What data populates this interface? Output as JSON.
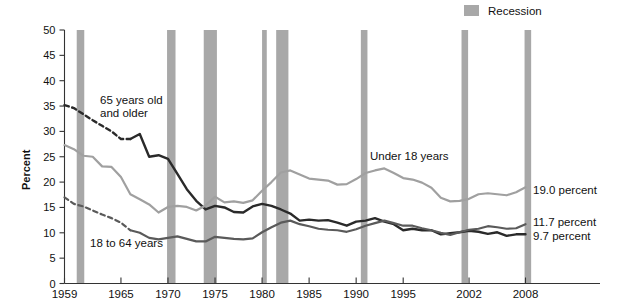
{
  "chart_data": {
    "type": "line",
    "title": "",
    "xlabel": "",
    "ylabel": "Percent",
    "ylim": [
      0,
      50
    ],
    "xlim": [
      1959,
      2008
    ],
    "ytickstep": 5,
    "grid": false,
    "legend_position": "top-right",
    "ytick_labels": [
      "0",
      "5",
      "10",
      "15",
      "20",
      "25",
      "30",
      "35",
      "40",
      "45",
      "50"
    ],
    "xtick_labels": [
      "1959",
      "1965",
      "1970",
      "1975",
      "1980",
      "1985",
      "1990",
      "1995",
      "2002",
      "2008"
    ],
    "xtick_values": [
      1959,
      1965,
      1970,
      1975,
      1980,
      1985,
      1990,
      1995,
      2002,
      2008
    ],
    "legend": [
      {
        "label": "Recession",
        "color": "#a8a8a8",
        "type": "band"
      }
    ],
    "series": [
      {
        "name": "65 years old and older",
        "color": "#2a2a2a",
        "label_text": "65 years old\nand older",
        "label_line1": "65 years old",
        "label_line2": "and older",
        "end_label": "9.7 percent",
        "end_value": 9.7,
        "dashed_until": 1966,
        "x": [
          1959,
          1960,
          1961,
          1962,
          1963,
          1964,
          1965,
          1966,
          1967,
          1968,
          1969,
          1970,
          1971,
          1972,
          1973,
          1974,
          1975,
          1976,
          1977,
          1978,
          1979,
          1980,
          1981,
          1982,
          1983,
          1984,
          1985,
          1986,
          1987,
          1988,
          1989,
          1990,
          1991,
          1992,
          1993,
          1994,
          1995,
          1996,
          1997,
          1998,
          1999,
          2000,
          2001,
          2002,
          2003,
          2004,
          2005,
          2006,
          2007,
          2008
        ],
        "values": [
          35.2,
          34.6,
          33.4,
          32.2,
          31.1,
          30.0,
          28.5,
          28.5,
          29.5,
          25.0,
          25.3,
          24.6,
          21.6,
          18.6,
          16.3,
          14.6,
          15.3,
          15.0,
          14.1,
          14.0,
          15.2,
          15.7,
          15.3,
          14.6,
          13.8,
          12.4,
          12.6,
          12.4,
          12.5,
          12.0,
          11.4,
          12.2,
          12.4,
          12.9,
          12.2,
          11.7,
          10.5,
          10.8,
          10.5,
          10.5,
          9.7,
          9.9,
          10.1,
          10.4,
          10.2,
          9.8,
          10.1,
          9.4,
          9.7,
          9.7
        ]
      },
      {
        "name": "Under 18 years",
        "color": "#a0a0a0",
        "label_text": "Under 18 years",
        "end_label": "19.0 percent",
        "end_value": 19.0,
        "dashed_until": null,
        "x": [
          1959,
          1960,
          1961,
          1962,
          1963,
          1964,
          1965,
          1966,
          1967,
          1968,
          1969,
          1970,
          1971,
          1972,
          1973,
          1974,
          1975,
          1976,
          1977,
          1978,
          1979,
          1980,
          1981,
          1982,
          1983,
          1984,
          1985,
          1986,
          1987,
          1988,
          1989,
          1990,
          1991,
          1992,
          1993,
          1994,
          1995,
          1996,
          1997,
          1998,
          1999,
          2000,
          2001,
          2002,
          2003,
          2004,
          2005,
          2006,
          2007,
          2008
        ],
        "values": [
          27.3,
          26.5,
          25.2,
          25.0,
          23.1,
          23.0,
          21.0,
          17.6,
          16.6,
          15.6,
          14.0,
          15.1,
          15.3,
          15.1,
          14.4,
          15.4,
          17.1,
          16.0,
          16.2,
          15.9,
          16.4,
          18.3,
          20.0,
          21.9,
          22.3,
          21.5,
          20.7,
          20.5,
          20.3,
          19.5,
          19.6,
          20.6,
          21.8,
          22.3,
          22.7,
          21.8,
          20.8,
          20.5,
          19.9,
          18.9,
          16.9,
          16.2,
          16.3,
          16.7,
          17.6,
          17.8,
          17.6,
          17.4,
          18.0,
          19.0
        ]
      },
      {
        "name": "18 to 64 years",
        "color": "#5a5a5a",
        "label_text": "18 to 64 years",
        "end_label": "11.7 percent",
        "end_value": 11.7,
        "dashed_until": 1966,
        "x": [
          1959,
          1960,
          1961,
          1962,
          1963,
          1964,
          1965,
          1966,
          1967,
          1968,
          1969,
          1970,
          1971,
          1972,
          1973,
          1974,
          1975,
          1976,
          1977,
          1978,
          1979,
          1980,
          1981,
          1982,
          1983,
          1984,
          1985,
          1986,
          1987,
          1988,
          1989,
          1990,
          1991,
          1992,
          1993,
          1994,
          1995,
          1996,
          1997,
          1998,
          1999,
          2000,
          2001,
          2002,
          2003,
          2004,
          2005,
          2006,
          2007,
          2008
        ],
        "values": [
          17.0,
          15.7,
          15.2,
          14.4,
          13.6,
          12.9,
          12.0,
          10.5,
          10.0,
          9.0,
          8.7,
          9.0,
          9.3,
          8.8,
          8.3,
          8.3,
          9.2,
          9.0,
          8.8,
          8.7,
          8.9,
          10.1,
          11.1,
          12.0,
          12.4,
          11.7,
          11.3,
          10.8,
          10.6,
          10.5,
          10.2,
          10.7,
          11.4,
          11.9,
          12.4,
          11.9,
          11.4,
          11.4,
          10.9,
          10.5,
          10.0,
          9.6,
          10.1,
          10.6,
          10.8,
          11.3,
          11.1,
          10.8,
          10.9,
          11.7
        ]
      }
    ]
  },
  "axis": {
    "y_title": "Percent"
  },
  "legend": {
    "recession_label": "Recession"
  },
  "recessions": [
    {
      "start": 1960.3,
      "end": 1961.1
    },
    {
      "start": 1969.9,
      "end": 1970.8
    },
    {
      "start": 1973.8,
      "end": 1975.2
    },
    {
      "start": 1980.0,
      "end": 1980.5
    },
    {
      "start": 1981.5,
      "end": 1982.8
    },
    {
      "start": 1990.5,
      "end": 1991.2
    },
    {
      "start": 2001.2,
      "end": 2001.9
    },
    {
      "start": 2007.9,
      "end": 2008.6
    }
  ]
}
